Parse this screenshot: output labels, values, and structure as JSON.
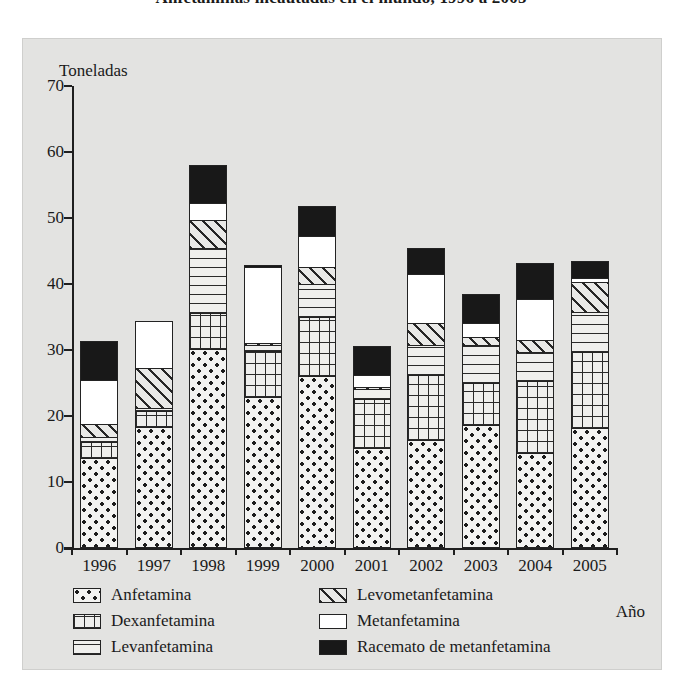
{
  "title": "Anfetaminas incautadas en el mundo, 1996 a 2005",
  "axis": {
    "y_unit_label": "Toneladas",
    "x_title": "Año",
    "y_ticks": [
      70,
      60,
      50,
      40,
      30,
      20,
      10,
      0
    ],
    "ylim": [
      0,
      70
    ]
  },
  "legend": {
    "left": [
      {
        "label": "Anfetamina",
        "pattern": "dotted",
        "key": "anfetamina"
      },
      {
        "label": "Dexanfetamina",
        "pattern": "grid",
        "key": "dexanfetamina"
      },
      {
        "label": "Levanfetamina",
        "pattern": "horizontal-lines",
        "key": "levanfetamina"
      }
    ],
    "right": [
      {
        "label": "Levometanfetamina",
        "pattern": "diagonal-hatch",
        "key": "levometanfetamina"
      },
      {
        "label": "Metanfetamina",
        "pattern": "white",
        "key": "metanfetamina"
      },
      {
        "label": "Racemato de metanfetamina",
        "pattern": "solid-black",
        "key": "racemato"
      }
    ]
  },
  "chart_data": {
    "type": "bar",
    "subtype": "stacked",
    "title": "Anfetaminas incautadas en el mundo, 1996 a 2005",
    "xlabel": "Año",
    "ylabel": "Toneladas",
    "ylim": [
      0,
      70
    ],
    "ytick_step": 10,
    "grid": false,
    "legend_position": "bottom",
    "categories": [
      "1996",
      "1997",
      "1998",
      "1999",
      "2000",
      "2001",
      "2002",
      "2003",
      "2004",
      "2005"
    ],
    "series": [
      {
        "name": "Anfetamina",
        "color": "#f3f3f1",
        "pattern": "dotted",
        "values": [
          13.7,
          18.4,
          30.1,
          22.9,
          26.1,
          15.1,
          16.4,
          18.6,
          14.4,
          18.2
        ]
      },
      {
        "name": "Dexanfetamina",
        "color": "#eeeeec",
        "pattern": "grid",
        "values": [
          2.5,
          2.5,
          5.6,
          7.1,
          9.1,
          7.7,
          10.0,
          6.5,
          11.0,
          11.6
        ]
      },
      {
        "name": "Levanfetamina",
        "color": "#efefed",
        "pattern": "horizontal-lines",
        "values": [
          1.0,
          0.6,
          10.1,
          1.1,
          5.1,
          1.6,
          4.7,
          5.9,
          4.6,
          6.2
        ]
      },
      {
        "name": "Levometanfetamina",
        "color": "#e9e9e7",
        "pattern": "diagonal-hatch",
        "values": [
          2.0,
          6.3,
          4.4,
          0.4,
          2.8,
          0.5,
          3.5,
          1.5,
          1.9,
          4.8
        ]
      },
      {
        "name": "Metanfetamina",
        "color": "#ffffff",
        "pattern": "white",
        "values": [
          6.8,
          7.2,
          2.7,
          11.7,
          4.8,
          2.0,
          7.6,
          2.2,
          6.5,
          0.7
        ]
      },
      {
        "name": "Racemato de metanfetamina",
        "color": "#181818",
        "pattern": "solid-black",
        "values": [
          6.1,
          0.0,
          5.9,
          0.5,
          4.7,
          4.5,
          4.0,
          4.5,
          5.5,
          2.8
        ]
      }
    ],
    "totals": [
      32.1,
      35.0,
      58.8,
      43.7,
      52.6,
      31.4,
      46.2,
      39.2,
      43.9,
      44.3
    ]
  }
}
